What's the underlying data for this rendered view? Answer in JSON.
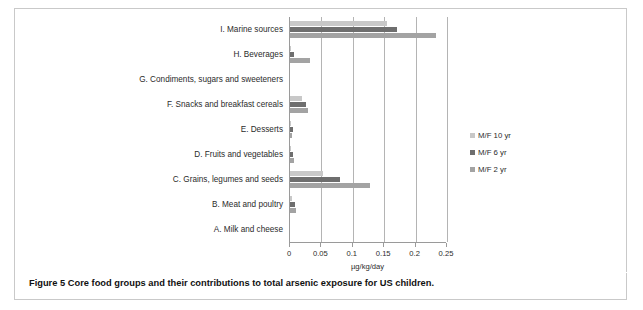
{
  "figure": {
    "caption_label": "Figure 5",
    "caption_text": "Core food groups and their contributions to total arsenic exposure for US children."
  },
  "legend": {
    "position": "right",
    "items": [
      {
        "label": "M/F 10 yr",
        "color": "#c8c8c8"
      },
      {
        "label": "M/F 6 yr",
        "color": "#6e6e6e"
      },
      {
        "label": "M/F 2 yr",
        "color": "#a3a3a3"
      }
    ]
  },
  "axis": {
    "title": "µg/kg/day",
    "ticks": [
      "0",
      "0.05",
      "0.1",
      "0.15",
      "0.2",
      "0.25"
    ]
  },
  "categories": [
    "I. Marine sources",
    "H. Beverages",
    "G. Condiments, sugars and sweeteners",
    "F. Snacks and breakfast cereals",
    "E. Desserts",
    "D. Fruits and vegetables",
    "C. Grains, legumes and seeds",
    "B. Meat and poultry",
    "A. Milk and cheese"
  ],
  "chart_data": {
    "type": "bar",
    "orientation": "horizontal",
    "title": "",
    "subtitle": "",
    "xlabel": "µg/kg/day",
    "ylabel": "",
    "xlim": [
      0,
      0.25
    ],
    "xticks": [
      0,
      0.05,
      0.1,
      0.15,
      0.2,
      0.25
    ],
    "grid": "vertical",
    "legend_position": "right",
    "categories": [
      "I. Marine sources",
      "H. Beverages",
      "G. Condiments, sugars and sweeteners",
      "F. Snacks and breakfast cereals",
      "E. Desserts",
      "D. Fruits and vegetables",
      "C. Grains, legumes and seeds",
      "B. Meat and poultry",
      "A. Milk and cheese"
    ],
    "series": [
      {
        "name": "M/F 10 yr",
        "color": "#c8c8c8",
        "values": [
          0.155,
          0.001,
          0.0,
          0.019,
          0.002,
          0.002,
          0.052,
          0.003,
          0.0
        ]
      },
      {
        "name": "M/F 6 yr",
        "color": "#6e6e6e",
        "values": [
          0.171,
          0.007,
          0.0,
          0.026,
          0.004,
          0.004,
          0.079,
          0.008,
          0.0
        ]
      },
      {
        "name": "M/F 2 yr",
        "color": "#a3a3a3",
        "values": [
          0.232,
          0.032,
          0.0,
          0.029,
          0.003,
          0.007,
          0.128,
          0.01,
          0.0
        ]
      }
    ]
  }
}
